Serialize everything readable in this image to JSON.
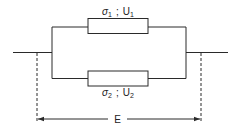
{
  "diagram": {
    "type": "parallel-circuit",
    "elements": [
      {
        "id": "element-1",
        "label_symbol": "σ",
        "label_sub": "1",
        "separator": ";",
        "label_var": "U",
        "label_var_sub": "1"
      },
      {
        "id": "element-2",
        "label_symbol": "σ",
        "label_sub": "2",
        "separator": ";",
        "label_var": "U",
        "label_var_sub": "2"
      }
    ],
    "dimension": {
      "label": "E"
    }
  }
}
